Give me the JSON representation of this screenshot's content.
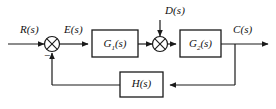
{
  "diagram": {
    "type": "control-block-diagram",
    "colors": {
      "line": "#1a1a1a",
      "block_stroke": "#1a1a1a",
      "block_fill": "#ffffff",
      "background": "#ffffff",
      "text": "#111111"
    },
    "signals": {
      "input_reference": "R(s)",
      "error": "E(s)",
      "disturbance": "D(s)",
      "output": "C(s)"
    },
    "blocks": [
      {
        "id": "G1",
        "label_main": "G",
        "label_sub": "1",
        "label_tail": "(s)",
        "label": "G1(s)"
      },
      {
        "id": "G2",
        "label_main": "G",
        "label_sub": "2",
        "label_tail": "(s)",
        "label": "G2(s)"
      },
      {
        "id": "H",
        "label_main": "H",
        "label_sub": "",
        "label_tail": "(s)",
        "label": "H(s)"
      }
    ],
    "summing_junctions": [
      {
        "id": "sum1",
        "signs": [
          "+",
          "-"
        ],
        "negative_sign": "−"
      },
      {
        "id": "sum2",
        "signs": [
          "+",
          "+"
        ],
        "negative_sign": ""
      }
    ]
  }
}
